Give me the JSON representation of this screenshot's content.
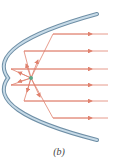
{
  "figure": {
    "caption": "(b)",
    "colors": {
      "mirror_fill": "#a9c4d6",
      "mirror_edge": "#6f8fa6",
      "ray": "#e0826e",
      "focus": "#5aa88a"
    },
    "focus": {
      "x": 31,
      "y": 78
    },
    "rays_y": [
      34,
      51,
      69,
      85,
      101,
      118
    ]
  }
}
